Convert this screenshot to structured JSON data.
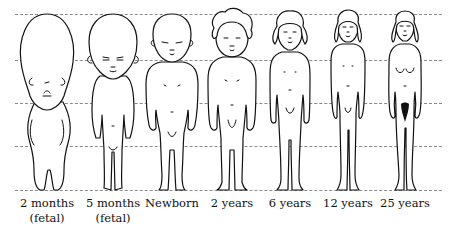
{
  "guide_lines": {
    "count": 5,
    "y_positions": [
      14,
      60,
      103,
      146,
      190
    ],
    "style": "dashed",
    "color": "#8a8a8a"
  },
  "figures": [
    {
      "id": "2-months-fetal",
      "label_line1": "2 months",
      "label_line2": "(fetal)",
      "center_x": 47,
      "head_fraction": "1/2"
    },
    {
      "id": "5-months-fetal",
      "label_line1": "5 months",
      "label_line2": "(fetal)",
      "center_x": 113,
      "head_fraction": "1/3"
    },
    {
      "id": "newborn",
      "label_line1": "Newborn",
      "label_line2": "",
      "center_x": 172,
      "head_fraction": "1/4"
    },
    {
      "id": "2-years",
      "label_line1": "2 years",
      "label_line2": "",
      "center_x": 232,
      "head_fraction": "1/5"
    },
    {
      "id": "6-years",
      "label_line1": "6 years",
      "label_line2": "",
      "center_x": 290,
      "head_fraction": "1/6"
    },
    {
      "id": "12-years",
      "label_line1": "12 years",
      "label_line2": "",
      "center_x": 348,
      "head_fraction": "1/7"
    },
    {
      "id": "25-years",
      "label_line1": "25 years",
      "label_line2": "",
      "center_x": 405,
      "head_fraction": "1/8"
    }
  ]
}
